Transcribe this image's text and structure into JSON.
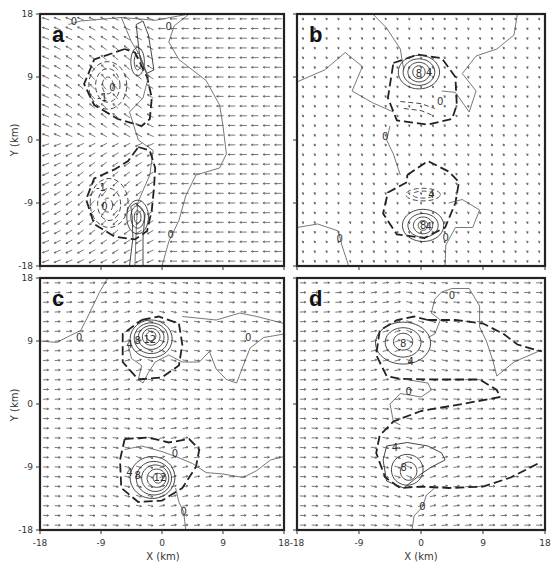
{
  "figure": {
    "axes": {
      "x_label": "X (km)",
      "y_label": "Y (km)",
      "x_ticks": [
        "-18",
        "-9",
        "0",
        "9",
        "18"
      ],
      "y_ticks": [
        "18",
        "9",
        "0",
        "-9",
        "-18"
      ],
      "range": [
        -18,
        18
      ]
    },
    "panels": [
      {
        "letter": "a",
        "box": [
          40,
          14,
          284,
          266
        ],
        "wind": "westward-easterly",
        "show_y_axis": true,
        "show_x_axis": false,
        "contour_labels": [
          {
            "text": "0",
            "x": -13,
            "y": 16.8
          },
          {
            "text": "0",
            "x": 1,
            "y": 16.2
          },
          {
            "text": "-1",
            "x": -8.8,
            "y": 6
          },
          {
            "text": "0",
            "x": -7.3,
            "y": 7.5
          },
          {
            "text": "-1",
            "x": -9,
            "y": -6.8
          },
          {
            "text": "0",
            "x": -8.5,
            "y": -9.5
          },
          {
            "text": "0",
            "x": 1.3,
            "y": -13.6
          }
        ]
      },
      {
        "letter": "b",
        "box": [
          297,
          14,
          545,
          266
        ],
        "wind": "weak",
        "show_y_axis": false,
        "show_x_axis": false,
        "contour_labels": [
          {
            "text": "8",
            "x": -0.3,
            "y": 9.5
          },
          {
            "text": "4",
            "x": 1.2,
            "y": 9.6
          },
          {
            "text": "0",
            "x": 2.8,
            "y": 5.5
          },
          {
            "text": "0",
            "x": -5.2,
            "y": 0.5
          },
          {
            "text": "4",
            "x": 1.5,
            "y": -7.8
          },
          {
            "text": "8",
            "x": 0.3,
            "y": -12.3
          },
          {
            "text": "4",
            "x": 1.1,
            "y": -12.4
          },
          {
            "text": "0",
            "x": -11.8,
            "y": -14.2
          },
          {
            "text": "0",
            "x": 3.6,
            "y": -14.0
          }
        ]
      },
      {
        "letter": "c",
        "box": [
          40,
          278,
          284,
          530
        ],
        "wind": "eastward-westerly",
        "show_y_axis": true,
        "show_x_axis": true,
        "contour_labels": [
          {
            "text": "0",
            "x": -12.2,
            "y": 9.5
          },
          {
            "text": "12",
            "x": -1.8,
            "y": 9.2
          },
          {
            "text": "8",
            "x": -3.6,
            "y": 9.0
          },
          {
            "text": "4",
            "x": -4.8,
            "y": 8.4
          },
          {
            "text": "0",
            "x": 12.7,
            "y": 9.5
          },
          {
            "text": "0",
            "x": 1.9,
            "y": -7.2
          },
          {
            "text": "4",
            "x": -4.8,
            "y": -9.8
          },
          {
            "text": "8",
            "x": -3.6,
            "y": -10.3
          },
          {
            "text": "12",
            "x": -0.3,
            "y": -10.5
          },
          {
            "text": "0",
            "x": 3.2,
            "y": -15.4
          }
        ]
      },
      {
        "letter": "d",
        "box": [
          297,
          278,
          545,
          530
        ],
        "wind": "eastward-westerly",
        "show_y_axis": false,
        "show_x_axis": true,
        "contour_labels": [
          {
            "text": "0",
            "x": 4.5,
            "y": 15.5
          },
          {
            "text": "8",
            "x": -2.6,
            "y": 8.6
          },
          {
            "text": "4",
            "x": -1.5,
            "y": 6.0
          },
          {
            "text": "0",
            "x": -1.8,
            "y": 1.7
          },
          {
            "text": "4",
            "x": -3.8,
            "y": -6.3
          },
          {
            "text": "8",
            "x": -2.5,
            "y": -9.2
          },
          {
            "text": "0",
            "x": 0.2,
            "y": -14.7
          }
        ]
      }
    ]
  }
}
